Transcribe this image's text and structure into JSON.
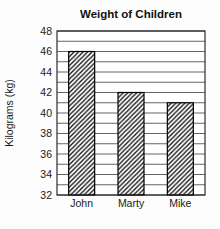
{
  "chart_data": {
    "type": "bar",
    "title": "Weight of Children",
    "ylabel": "Kilograms (kg)",
    "xlabel": "",
    "categories": [
      "John",
      "Marty",
      "Mike"
    ],
    "values": [
      46,
      42,
      41
    ],
    "ylim": [
      32,
      48
    ],
    "ytick_step": 2,
    "grid_step": 1,
    "grid": true,
    "legend": "none",
    "bar_style": "diagonal-hatch",
    "colors": {
      "background": "#fdfdfd",
      "plot_background": "#ffffff",
      "gridline": "#3f3f3f",
      "frame": "#1a1a1a",
      "bar_outline": "#000000",
      "hatch_line": "#111111",
      "text": "#1a1a1a"
    }
  }
}
